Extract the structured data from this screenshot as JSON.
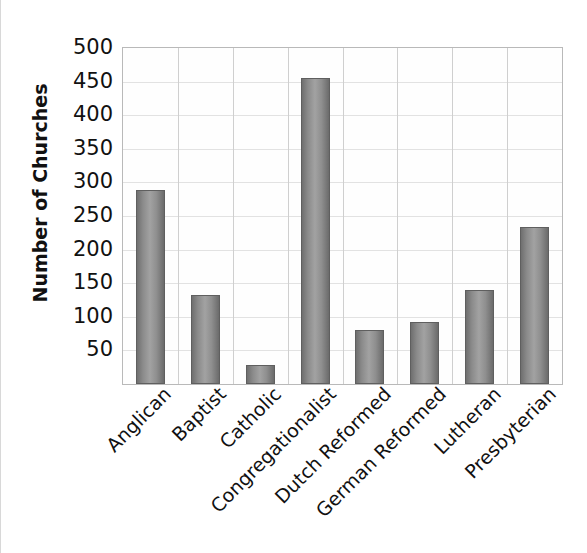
{
  "chart_data": {
    "type": "bar",
    "title": "",
    "xlabel": "",
    "ylabel": "Number of Churches",
    "ylim": [
      0,
      500
    ],
    "ytick_interval": 50,
    "yticks": [
      50,
      100,
      150,
      200,
      250,
      300,
      350,
      400,
      450,
      500
    ],
    "ytick_labels": [
      "50",
      "100",
      "150",
      "200",
      "250",
      "300",
      "350",
      "400",
      "450",
      "500"
    ],
    "grid": "both",
    "legend": "none",
    "bar_color": "#8c8c8c",
    "bar_edge_color": "#5f5f5f",
    "plot_border_color": "#b9b9b9",
    "gridline_color": "#e2e2e2",
    "categories": [
      "Anglican",
      "Baptist",
      "Catholic",
      "Congregationalist",
      "Dutch Reformed",
      "German Reformed",
      "Lutheran",
      "Presbyterian"
    ],
    "values": [
      288,
      132,
      28,
      455,
      80,
      92,
      140,
      233
    ]
  }
}
